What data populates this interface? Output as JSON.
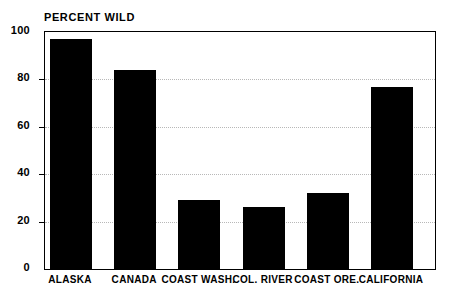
{
  "chart_data": {
    "type": "bar",
    "title": "PERCENT WILD",
    "xlabel": "",
    "ylabel": "",
    "ylim": [
      0,
      100
    ],
    "yticks": [
      0,
      20,
      40,
      60,
      80,
      100
    ],
    "ytick_labels": [
      "0",
      "20",
      "40",
      "60",
      "80",
      "100"
    ],
    "grid": true,
    "grid_axis": "y",
    "legend": false,
    "bar_color": "#000000",
    "background_color": "#ffffff",
    "categories": [
      "ALASKA",
      "CANADA",
      "COAST WASH.",
      "COL. RIVER",
      "COAST ORE.",
      "CALIFORNIA"
    ],
    "values": [
      97,
      84,
      29,
      26,
      32,
      77
    ]
  }
}
